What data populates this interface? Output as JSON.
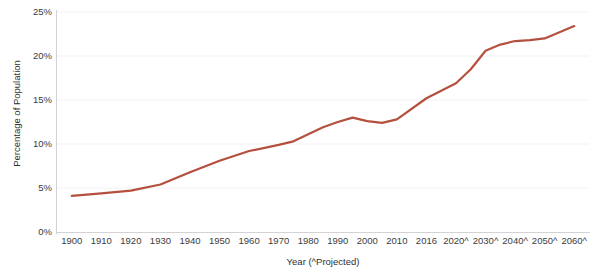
{
  "chart_data": {
    "type": "line",
    "title": "Percentage of U.S. Population Age 65 and Over",
    "xlabel": "Year (^Projected)",
    "ylabel": "Percentage of Population",
    "ylim": [
      0,
      25
    ],
    "ytick_labels": [
      "0%",
      "5%",
      "10%",
      "15%",
      "20%",
      "25%"
    ],
    "ytick_values": [
      0,
      5,
      10,
      15,
      20,
      25
    ],
    "grid": true,
    "legend": "none",
    "series_color": "#b5503f",
    "categories": [
      "1900",
      "1910",
      "1920",
      "1930",
      "1940",
      "1950",
      "1960",
      "1970",
      "1980",
      "1990",
      "2000",
      "2010",
      "2016",
      "2020^",
      "2030^",
      "2040^",
      "2050^",
      "2060^"
    ],
    "series": [
      {
        "name": "Percentage of Population",
        "values": [
          4.1,
          4.4,
          4.7,
          5.4,
          6.8,
          8.1,
          9.2,
          9.9,
          11.3,
          12.6,
          12.4,
          13.0,
          15.2,
          16.9,
          20.6,
          21.7,
          22.0,
          23.4
        ]
      }
    ],
    "annotations": [
      {
        "label": "peak-1995",
        "x": "1995",
        "y": 13.0
      },
      {
        "label": "dip-2005",
        "x": "2005",
        "y": 12.4
      }
    ],
    "detail_points": [
      {
        "x": "1900",
        "y": 4.1
      },
      {
        "x": "1910",
        "y": 4.4
      },
      {
        "x": "1920",
        "y": 4.7
      },
      {
        "x": "1930",
        "y": 5.4
      },
      {
        "x": "1940",
        "y": 6.8
      },
      {
        "x": "1950",
        "y": 8.1
      },
      {
        "x": "1960",
        "y": 9.2
      },
      {
        "x": "1970",
        "y": 9.9
      },
      {
        "x": "1975",
        "y": 10.3
      },
      {
        "x": "1985",
        "y": 11.9
      },
      {
        "x": "1990",
        "y": 12.5
      },
      {
        "x": "1995",
        "y": 13.0
      },
      {
        "x": "2000",
        "y": 12.6
      },
      {
        "x": "2005",
        "y": 12.4
      },
      {
        "x": "2010",
        "y": 12.8
      },
      {
        "x": "2016",
        "y": 15.2
      },
      {
        "x": "2020^",
        "y": 16.9
      },
      {
        "x": "2025^",
        "y": 18.5
      },
      {
        "x": "2030^",
        "y": 20.6
      },
      {
        "x": "2035^",
        "y": 21.3
      },
      {
        "x": "2040^",
        "y": 21.7
      },
      {
        "x": "2045^",
        "y": 21.8
      },
      {
        "x": "2050^",
        "y": 22.0
      },
      {
        "x": "2060^",
        "y": 23.4
      }
    ]
  }
}
